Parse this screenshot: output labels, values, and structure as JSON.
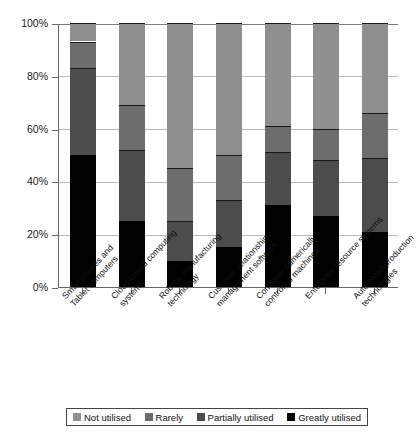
{
  "chart_data": {
    "type": "bar",
    "subtype": "stacked-percentage-column",
    "title": "",
    "xlabel": "",
    "ylabel": "",
    "ylim": [
      0,
      100
    ],
    "ytick_labels": [
      "0%",
      "20%",
      "40%",
      "60%",
      "80%",
      "100%"
    ],
    "ytick_values": [
      0,
      20,
      40,
      60,
      80,
      100
    ],
    "grid": true,
    "legend_position": "bottom",
    "categories": [
      "Smart phones and Tablet computers",
      "Cloud-based computing systems",
      "Robotic manufacturing technology",
      "Customer relationship management software",
      "Computer numerically controlled machines",
      "Enterprise resource systems",
      "Automated production technologies"
    ],
    "category_lines": [
      [
        "Smart phones and",
        "Tablet computers"
      ],
      [
        "Cloud-based computing",
        "systems"
      ],
      [
        "Robotic manufacturing",
        "technology"
      ],
      [
        "Customer relationship",
        "management software"
      ],
      [
        "Computer numerically",
        "controlled machines"
      ],
      [
        "Enterprise resource systems"
      ],
      [
        "Automated production",
        "technologies"
      ]
    ],
    "series": [
      {
        "name": "Greatly utilised",
        "color": "#000000",
        "values": [
          50,
          25,
          10,
          15,
          31,
          27,
          21
        ]
      },
      {
        "name": "Partially utilised",
        "color": "#4c4c4c",
        "values": [
          33,
          27,
          15,
          18,
          20,
          21,
          28
        ]
      },
      {
        "name": "Rarely",
        "color": "#6d6d6d",
        "values": [
          10,
          17,
          20,
          17,
          10,
          12,
          17
        ]
      },
      {
        "name": "Not utilised",
        "color": "#8f8f8f",
        "values": [
          7,
          31,
          55,
          50,
          39,
          40,
          34
        ]
      }
    ],
    "stack_order_bottom_to_top": [
      "Greatly utilised",
      "Partially utilised",
      "Rarely",
      "Not utilised"
    ]
  },
  "legend": {
    "items": [
      {
        "label": "Not utilised",
        "swatch": "not-utilised-swatch"
      },
      {
        "label": "Rarely",
        "swatch": "rarely-swatch"
      },
      {
        "label": "Partially utilised",
        "swatch": "partially-utilised-swatch"
      },
      {
        "label": "Greatly utilised",
        "swatch": "greatly-utilised-swatch"
      }
    ]
  },
  "colors": {
    "not_utilised": "#8f8f8f",
    "rarely": "#6d6d6d",
    "partially_utilised": "#4c4c4c",
    "greatly_utilised": "#000000",
    "grid": "#b9b9b9",
    "axis": "#666666"
  }
}
